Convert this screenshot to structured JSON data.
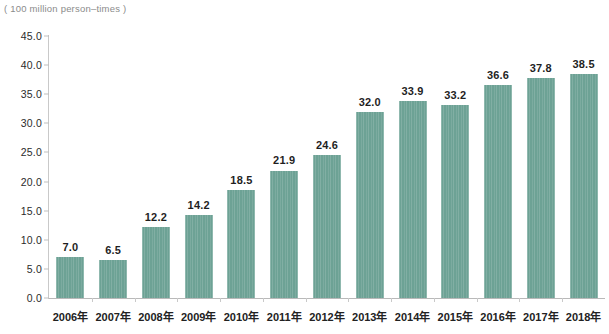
{
  "chart_data": {
    "type": "bar",
    "title": "",
    "subtitle": "",
    "unit_caption": "( 100 million person–times )",
    "xlabel": "",
    "ylabel": "",
    "ylim": [
      0.0,
      45.0
    ],
    "y_tick_step": 5.0,
    "grid": false,
    "legend": null,
    "legend_position": "none",
    "bar_color": "#6da295",
    "axis_color": "#c9c9c9",
    "label_color": "#1f1f1f",
    "categories": [
      "2006年",
      "2007年",
      "2008年",
      "2009年",
      "2010年",
      "2011年",
      "2012年",
      "2013年",
      "2014年",
      "2015年",
      "2016年",
      "2017年",
      "2018年"
    ],
    "values": [
      7.0,
      6.5,
      12.2,
      14.2,
      18.5,
      21.9,
      24.6,
      32.0,
      33.9,
      33.2,
      36.6,
      37.8,
      38.5
    ],
    "value_labels": [
      "7.0",
      "6.5",
      "12.2",
      "14.2",
      "18.5",
      "21.9",
      "24.6",
      "32.0",
      "33.9",
      "33.2",
      "36.6",
      "37.8",
      "38.5"
    ],
    "y_tick_labels": [
      "0.0",
      "5.0",
      "10.0",
      "15.0",
      "20.0",
      "25.0",
      "30.0",
      "35.0",
      "40.0",
      "45.0"
    ],
    "y_tick_values": [
      0.0,
      5.0,
      10.0,
      15.0,
      20.0,
      25.0,
      30.0,
      35.0,
      40.0,
      45.0
    ]
  }
}
